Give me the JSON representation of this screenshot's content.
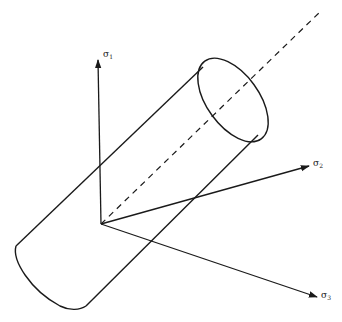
{
  "diagram": {
    "axes": [
      {
        "id": "sigma1",
        "symbol": "σ",
        "subscript": "1",
        "direction": "vertical-up"
      },
      {
        "id": "sigma2",
        "symbol": "σ",
        "subscript": "2",
        "direction": "right-up"
      },
      {
        "id": "sigma3",
        "symbol": "σ",
        "subscript": "3",
        "direction": "right-down"
      }
    ],
    "elements": {
      "cylinder": "yield-cylinder",
      "hydrostatic_axis": "dashed-line"
    },
    "colors": {
      "stroke": "#1a1a1a",
      "background": "#ffffff"
    }
  }
}
